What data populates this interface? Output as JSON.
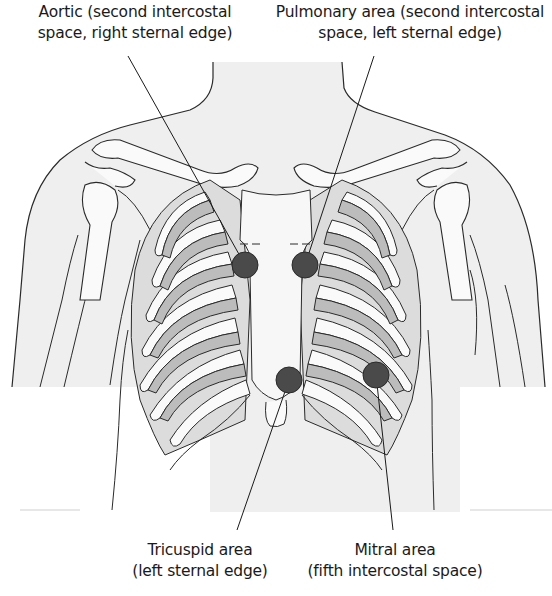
{
  "diagram": {
    "colors": {
      "skin_fill": "#efefef",
      "outline": "#2a2a2a",
      "rib_dark": "#bcbcbc",
      "rib_light": "#dddddd",
      "bone_white": "#fafafa",
      "auscultation_point": "#4a4a4a",
      "background": "#ffffff"
    },
    "labels": [
      {
        "id": "aortic",
        "line1": "Aortic (second intercostal",
        "line2": "space, right sternal edge)"
      },
      {
        "id": "pulmonary",
        "line1": "Pulmonary area (second intercostal",
        "line2": "space, left sternal edge)"
      },
      {
        "id": "tricuspid",
        "line1": "Tricuspid area",
        "line2": "(left sternal edge)"
      },
      {
        "id": "mitral",
        "line1": "Mitral area",
        "line2": "(fifth intercostal space)"
      }
    ],
    "points": [
      {
        "id": "aortic",
        "cx": 245,
        "cy": 265,
        "r": 13,
        "leader_from": [
          128,
          56
        ]
      },
      {
        "id": "pulmonary",
        "cx": 305,
        "cy": 265,
        "r": 13,
        "leader_from": [
          374,
          56
        ]
      },
      {
        "id": "tricuspid",
        "cx": 289,
        "cy": 380,
        "r": 13,
        "leader_from": [
          237,
          530
        ]
      },
      {
        "id": "mitral",
        "cx": 376,
        "cy": 375,
        "r": 13,
        "leader_from": [
          393,
          530
        ]
      }
    ]
  }
}
